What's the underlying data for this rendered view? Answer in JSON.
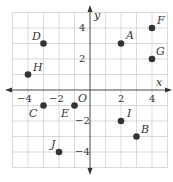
{
  "diagram": {
    "type": "coordinate-plane",
    "x_range": [
      -5,
      5
    ],
    "y_range": [
      -5,
      5
    ],
    "axis_labels": {
      "x": "x",
      "y": "y"
    },
    "origin_label": "O",
    "x_ticks": [
      {
        "value": -4,
        "label": "−4"
      },
      {
        "value": -2,
        "label": "−2"
      },
      {
        "value": 2,
        "label": "2"
      },
      {
        "value": 4,
        "label": "4"
      }
    ],
    "y_ticks": [
      {
        "value": 4,
        "label": "4"
      },
      {
        "value": 2,
        "label": "2"
      },
      {
        "value": -2,
        "label": "−2"
      },
      {
        "value": -4,
        "label": "−4"
      }
    ],
    "points": [
      {
        "name": "A",
        "x": 2,
        "y": 3
      },
      {
        "name": "B",
        "x": 3,
        "y": -3
      },
      {
        "name": "C",
        "x": -3,
        "y": -1
      },
      {
        "name": "D",
        "x": -3,
        "y": 3
      },
      {
        "name": "E",
        "x": -1,
        "y": -1
      },
      {
        "name": "F",
        "x": 4,
        "y": 4
      },
      {
        "name": "G",
        "x": 4,
        "y": 2
      },
      {
        "name": "H",
        "x": -4,
        "y": 1
      },
      {
        "name": "I",
        "x": 2,
        "y": -2
      },
      {
        "name": "J",
        "x": -2,
        "y": -4
      }
    ],
    "colors": {
      "grid": "#cfcfcf",
      "axis": "#333333",
      "point": "#333333"
    }
  }
}
